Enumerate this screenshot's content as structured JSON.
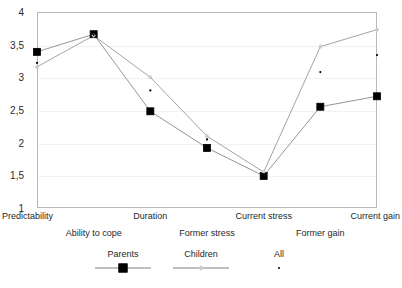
{
  "chart_data": {
    "type": "line",
    "title": "",
    "xlabel": "",
    "ylabel": "",
    "ylim": [
      1,
      4
    ],
    "yticks": [
      1,
      1.5,
      2,
      2.5,
      3,
      3.5,
      4
    ],
    "ytick_labels": [
      "1",
      "1,5",
      "2",
      "2,5",
      "3",
      "3,5",
      "4"
    ],
    "grid": true,
    "legend_position": "bottom",
    "decimal_separator": ",",
    "categories": [
      "Predictability",
      "Ability to cope",
      "Duration",
      "Former stress",
      "Current stress",
      "Former gain",
      "Current gain"
    ],
    "series": [
      {
        "name": "Parents",
        "marker": "square",
        "color": "#000000",
        "line_color": "#7a7a7a",
        "values": [
          3.39,
          3.66,
          2.48,
          1.92,
          1.49,
          2.55,
          2.71
        ]
      },
      {
        "name": "Children",
        "marker": "diamond",
        "color": "#c9c9c9",
        "line_color": "#8c8c8c",
        "values": [
          3.16,
          3.64,
          3.0,
          2.1,
          1.55,
          3.47,
          3.73
        ]
      },
      {
        "name": "All",
        "marker": "dot",
        "color": "#000000",
        "line_color": "none",
        "values": [
          3.22,
          3.65,
          2.8,
          2.05,
          1.52,
          3.08,
          3.34
        ]
      }
    ]
  },
  "legend": {
    "items": [
      {
        "label": "Parents",
        "key": "line-square"
      },
      {
        "label": "Children",
        "key": "line-diamond"
      },
      {
        "label": "All",
        "key": "dot"
      }
    ]
  }
}
